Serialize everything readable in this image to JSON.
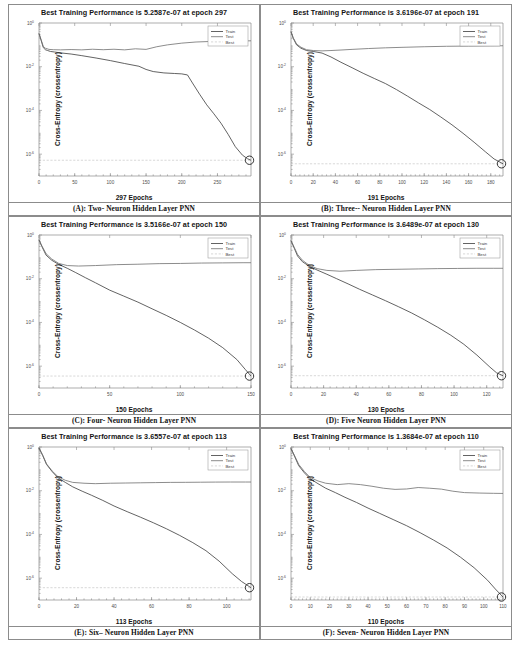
{
  "figure": {
    "y_axis_label": "Cross-Entropy  (crossentropy)",
    "legend": [
      "Train",
      "Test",
      "Best"
    ],
    "y_ticks": [
      "10^0",
      "10^-2",
      "10^-4",
      "10^-6"
    ],
    "colors": {
      "train": "#3b3b3b",
      "test": "#6e6e6e",
      "best": "#b0b0b0",
      "axis": "#8a8a8a",
      "border": "#8c8c8c"
    }
  },
  "panels": [
    {
      "id": "A",
      "title": "Best Training Performance is 5.2587e-07 at epoch 297",
      "xlabel": "297 Epochs",
      "caption": "(A): Two- Neuron Hidden Layer PNN",
      "chart_data": {
        "type": "line",
        "title": "Best Training Performance is 5.2587e-07 at epoch 297",
        "xlabel": "297 Epochs",
        "ylabel": "Cross-Entropy  (crossentropy)",
        "yscale": "log",
        "ylim": [
          1e-07,
          1
        ],
        "xlim": [
          0,
          297
        ],
        "xticks": [
          0,
          50,
          100,
          150,
          200,
          250
        ],
        "yticks": [
          1,
          0.01,
          0.0001,
          1e-06
        ],
        "grid": false,
        "legend": [
          "Train",
          "Test",
          "Best"
        ],
        "legend_position": "upper right",
        "best_value": 5.2587e-07,
        "best_epoch": 297,
        "series": [
          {
            "name": "Train",
            "x": [
              0,
              3,
              6,
              9,
              12,
              16,
              22,
              30,
              45,
              60,
              80,
              100,
              120,
              140,
              150,
              160,
              175,
              190,
              200,
              208,
              215,
              225,
              235,
              245,
              255,
              265,
              275,
              285,
              292,
              297
            ],
            "y": [
              0.33,
              0.16,
              0.075,
              0.06,
              0.055,
              0.05,
              0.047,
              0.043,
              0.038,
              0.032,
              0.025,
              0.019,
              0.014,
              0.0105,
              0.0075,
              0.006,
              0.0052,
              0.0049,
              0.0047,
              0.0042,
              0.0018,
              0.00055,
              0.00018,
              7e-05,
              2.6e-05,
              8e-06,
              2.2e-06,
              9e-07,
              6.2e-07,
              5.2587e-07
            ]
          },
          {
            "name": "Test",
            "x": [
              0,
              3,
              6,
              9,
              14,
              20,
              30,
              45,
              60,
              75,
              90,
              105,
              120,
              135,
              150,
              165,
              180,
              200,
              220,
              245,
              265,
              285,
              297
            ],
            "y": [
              0.33,
              0.17,
              0.085,
              0.07,
              0.062,
              0.06,
              0.059,
              0.061,
              0.059,
              0.063,
              0.06,
              0.063,
              0.059,
              0.066,
              0.062,
              0.082,
              0.1,
              0.12,
              0.135,
              0.145,
              0.15,
              0.152,
              0.153
            ]
          },
          {
            "name": "Best",
            "x": [
              0,
              297
            ],
            "y": [
              5.2587e-07,
              5.2587e-07
            ]
          }
        ]
      }
    },
    {
      "id": "B",
      "title": "Best Training Performance is 3.6196e-07 at epoch 191",
      "xlabel": "191 Epochs",
      "caption": "(B): Three-- Neuron Hidden Layer PNN",
      "chart_data": {
        "type": "line",
        "title": "Best Training Performance is 3.6196e-07 at epoch 191",
        "xlabel": "191 Epochs",
        "ylabel": "Cross-Entropy  (crossentropy)",
        "yscale": "log",
        "ylim": [
          1e-07,
          1
        ],
        "xlim": [
          0,
          191
        ],
        "xticks": [
          0,
          20,
          40,
          60,
          80,
          100,
          120,
          140,
          160,
          180
        ],
        "yticks": [
          1,
          0.01,
          0.0001,
          1e-06
        ],
        "grid": false,
        "legend": [
          "Train",
          "Test",
          "Best"
        ],
        "legend_position": "upper right",
        "best_value": 3.6196e-07,
        "best_epoch": 191,
        "series": [
          {
            "name": "Train",
            "x": [
              0,
              2,
              5,
              9,
              14,
              20,
              28,
              36,
              45,
              55,
              65,
              75,
              85,
              95,
              105,
              115,
              125,
              135,
              145,
              155,
              165,
              175,
              183,
              191
            ],
            "y": [
              0.4,
              0.2,
              0.1,
              0.07,
              0.055,
              0.05,
              0.042,
              0.028,
              0.016,
              0.009,
              0.005,
              0.0029,
              0.0017,
              0.0009,
              0.00045,
              0.00022,
              0.00011,
              5e-05,
              2.2e-05,
              9e-06,
              3.5e-06,
              1.3e-06,
              6e-07,
              3.6196e-07
            ]
          },
          {
            "name": "Test",
            "x": [
              0,
              2,
              5,
              9,
              14,
              20,
              28,
              36,
              45,
              55,
              70,
              85,
              100,
              120,
              140,
              160,
              180,
              191
            ],
            "y": [
              0.4,
              0.21,
              0.11,
              0.078,
              0.06,
              0.055,
              0.053,
              0.055,
              0.058,
              0.062,
              0.068,
              0.073,
              0.077,
              0.082,
              0.086,
              0.088,
              0.09,
              0.091
            ]
          },
          {
            "name": "Best",
            "x": [
              0,
              191
            ],
            "y": [
              3.6196e-07,
              3.6196e-07
            ]
          }
        ]
      }
    },
    {
      "id": "C",
      "title": "Best Training Performance is 3.5166e-07 at epoch 150",
      "xlabel": "150 Epochs",
      "caption": "(C): Four-  Neuron Hidden Layer PNN",
      "chart_data": {
        "type": "line",
        "title": "Best Training Performance is 3.5166e-07 at epoch 150",
        "xlabel": "150 Epochs",
        "ylabel": "Cross-Entropy  (crossentropy)",
        "yscale": "log",
        "ylim": [
          1e-07,
          1
        ],
        "xlim": [
          0,
          150
        ],
        "xticks": [
          0,
          50,
          100,
          150
        ],
        "yticks": [
          1,
          0.01,
          0.0001,
          1e-06
        ],
        "grid": false,
        "legend": [
          "Train",
          "Test",
          "Best"
        ],
        "legend_position": "upper right",
        "best_value": 3.5166e-07,
        "best_epoch": 150,
        "series": [
          {
            "name": "Train",
            "x": [
              0,
              2,
              5,
              9,
              14,
              20,
              26,
              33,
              40,
              50,
              60,
              70,
              80,
              90,
              100,
              110,
              120,
              130,
              140,
              146,
              150
            ],
            "y": [
              0.6,
              0.3,
              0.12,
              0.07,
              0.045,
              0.03,
              0.019,
              0.011,
              0.0065,
              0.003,
              0.0016,
              0.00085,
              0.00042,
              0.00021,
              0.0001,
              4.5e-05,
              1.9e-05,
              7e-06,
              2e-06,
              7e-07,
              3.5166e-07
            ]
          },
          {
            "name": "Test",
            "x": [
              0,
              2,
              5,
              9,
              14,
              20,
              28,
              40,
              55,
              70,
              85,
              100,
              115,
              130,
              145,
              150
            ],
            "y": [
              0.6,
              0.32,
              0.14,
              0.08,
              0.05,
              0.04,
              0.038,
              0.04,
              0.044,
              0.046,
              0.049,
              0.05,
              0.052,
              0.053,
              0.054,
              0.054
            ]
          },
          {
            "name": "Best",
            "x": [
              0,
              150
            ],
            "y": [
              3.5166e-07,
              3.5166e-07
            ]
          }
        ]
      }
    },
    {
      "id": "D",
      "title": "Best Training Performance is 3.6489e-07 at epoch 130",
      "xlabel": "130 Epochs",
      "caption": "(D): Five Neuron Hidden Layer PNN",
      "chart_data": {
        "type": "line",
        "title": "Best Training Performance is 3.6489e-07 at epoch 130",
        "xlabel": "130 Epochs",
        "ylabel": "Cross-Entropy  (crossentropy)",
        "yscale": "log",
        "ylim": [
          1e-07,
          1
        ],
        "xlim": [
          0,
          130
        ],
        "xticks": [
          0,
          20,
          40,
          60,
          80,
          100,
          120
        ],
        "yticks": [
          1,
          0.01,
          0.0001,
          1e-06
        ],
        "grid": false,
        "legend": [
          "Train",
          "Test",
          "Best"
        ],
        "legend_position": "upper right",
        "best_value": 3.6489e-07,
        "best_epoch": 130,
        "series": [
          {
            "name": "Train",
            "x": [
              0,
              2,
              4,
              7,
              11,
              16,
              22,
              28,
              35,
              42,
              50,
              58,
              66,
              74,
              82,
              90,
              98,
              106,
              114,
              122,
              126,
              130
            ],
            "y": [
              0.55,
              0.25,
              0.11,
              0.06,
              0.038,
              0.025,
              0.016,
              0.01,
              0.0058,
              0.0033,
              0.0018,
              0.00098,
              0.00052,
              0.00027,
              0.00013,
              6e-05,
              2.6e-05,
              1e-05,
              3.2e-06,
              9e-07,
              5e-07,
              3.6489e-07
            ]
          },
          {
            "name": "Test",
            "x": [
              0,
              2,
              4,
              7,
              11,
              16,
              22,
              30,
              40,
              52,
              65,
              78,
              90,
              102,
              114,
              124,
              130
            ],
            "y": [
              0.55,
              0.27,
              0.13,
              0.07,
              0.042,
              0.029,
              0.024,
              0.022,
              0.024,
              0.026,
              0.027,
              0.028,
              0.029,
              0.0295,
              0.03,
              0.03,
              0.03
            ]
          },
          {
            "name": "Best",
            "x": [
              0,
              130
            ],
            "y": [
              3.6489e-07,
              3.6489e-07
            ]
          }
        ]
      }
    },
    {
      "id": "E",
      "title": "Best Training Performance is 3.6557e-07 at epoch 113",
      "xlabel": "113 Epochs",
      "caption": "(E): Six– Neuron Hidden Layer PNN",
      "chart_data": {
        "type": "line",
        "title": "Best Training Performance is 3.6557e-07 at epoch 113",
        "xlabel": "113 Epochs",
        "ylabel": "Cross-Entropy  (crossentropy)",
        "yscale": "log",
        "ylim": [
          1e-07,
          1
        ],
        "xlim": [
          0,
          113
        ],
        "xticks": [
          0,
          20,
          40,
          60,
          80,
          100
        ],
        "yticks": [
          1,
          0.01,
          0.0001,
          1e-06
        ],
        "grid": false,
        "legend": [
          "Train",
          "Test",
          "Best"
        ],
        "legend_position": "upper right",
        "best_value": 3.6557e-07,
        "best_epoch": 113,
        "series": [
          {
            "name": "Train",
            "x": [
              0,
              2,
              4,
              7,
              10,
              14,
              18,
              23,
              28,
              34,
              40,
              47,
              54,
              61,
              68,
              75,
              82,
              89,
              96,
              103,
              108,
              113
            ],
            "y": [
              0.9,
              0.4,
              0.16,
              0.075,
              0.04,
              0.024,
              0.015,
              0.0095,
              0.0062,
              0.0036,
              0.002,
              0.0011,
              0.00062,
              0.00034,
              0.00018,
              9e-05,
              4.2e-05,
              1.8e-05,
              6e-06,
              1.6e-06,
              7e-07,
              3.6557e-07
            ]
          },
          {
            "name": "Test",
            "x": [
              0,
              2,
              4,
              7,
              10,
              14,
              18,
              24,
              30,
              38,
              46,
              54,
              62,
              70,
              78,
              86,
              94,
              102,
              110,
              113
            ],
            "y": [
              0.9,
              0.42,
              0.17,
              0.08,
              0.045,
              0.03,
              0.024,
              0.022,
              0.021,
              0.022,
              0.0225,
              0.023,
              0.0235,
              0.024,
              0.0242,
              0.0245,
              0.0248,
              0.025,
              0.025,
              0.025
            ]
          },
          {
            "name": "Best",
            "x": [
              0,
              113
            ],
            "y": [
              3.6557e-07,
              3.6557e-07
            ]
          }
        ]
      }
    },
    {
      "id": "F",
      "title": "Best Training Performance is 1.3684e-07 at epoch 110",
      "xlabel": "110 Epochs",
      "caption": "(F): Seven- Neuron Hidden Layer PNN",
      "chart_data": {
        "type": "line",
        "title": "Best Training Performance is 1.3684e-07 at epoch 110",
        "xlabel": "110 Epochs",
        "ylabel": "Cross-Entropy  (crossentropy)",
        "yscale": "log",
        "ylim": [
          1e-07,
          1
        ],
        "xlim": [
          0,
          110
        ],
        "xticks": [
          0,
          10,
          20,
          30,
          40,
          50,
          60,
          70,
          80,
          90,
          100,
          110
        ],
        "yticks": [
          1,
          0.01,
          0.0001,
          1e-06
        ],
        "grid": false,
        "legend": [
          "Train",
          "Test",
          "Best"
        ],
        "legend_position": "upper right",
        "best_value": 1.3684e-07,
        "best_epoch": 110,
        "series": [
          {
            "name": "Train",
            "x": [
              0,
              2,
              4,
              7,
              10,
              14,
              18,
              23,
              28,
              34,
              40,
              46,
              53,
              60,
              67,
              74,
              81,
              88,
              95,
              102,
              106,
              110
            ],
            "y": [
              0.85,
              0.35,
              0.14,
              0.065,
              0.035,
              0.021,
              0.013,
              0.0082,
              0.005,
              0.0029,
              0.0016,
              0.00092,
              0.00048,
              0.00025,
              0.00012,
              5.5e-05,
              2.4e-05,
              9e-06,
              3e-06,
              8e-07,
              3.2e-07,
              1.3684e-07
            ]
          },
          {
            "name": "Test",
            "x": [
              0,
              2,
              4,
              7,
              10,
              14,
              18,
              24,
              30,
              36,
              42,
              48,
              54,
              60,
              66,
              72,
              78,
              84,
              90,
              98,
              105,
              110
            ],
            "y": [
              0.85,
              0.38,
              0.16,
              0.075,
              0.04,
              0.028,
              0.022,
              0.019,
              0.021,
              0.019,
              0.016,
              0.013,
              0.0115,
              0.012,
              0.014,
              0.013,
              0.0118,
              0.0095,
              0.0082,
              0.0078,
              0.0076,
              0.0075
            ]
          },
          {
            "name": "Best",
            "x": [
              0,
              110
            ],
            "y": [
              1.3684e-07,
              1.3684e-07
            ]
          }
        ]
      }
    }
  ]
}
